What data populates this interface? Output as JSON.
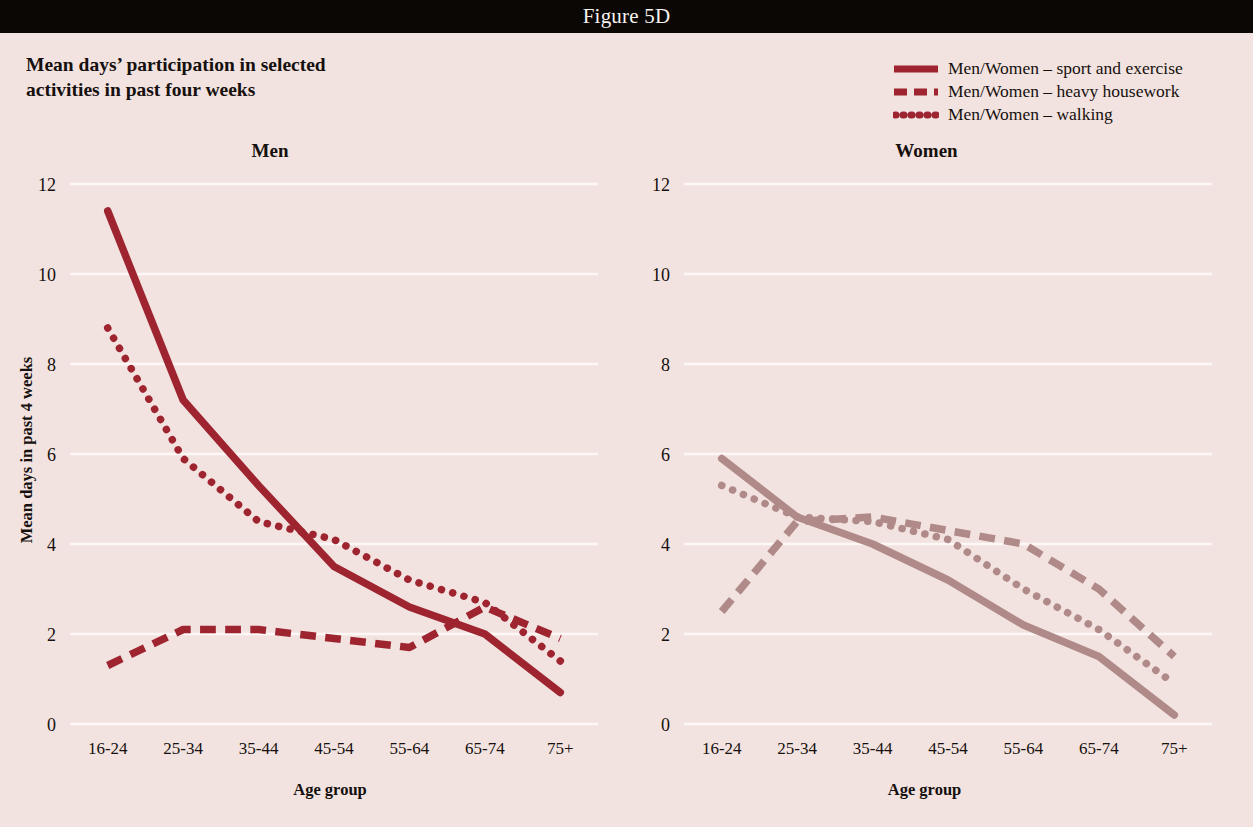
{
  "header": {
    "figure_label": "Figure 5D"
  },
  "title": {
    "line1": "Mean days’ participation in selected",
    "line2": "activities in past four weeks"
  },
  "legend": {
    "position": "top-right",
    "items": [
      {
        "label": "Men/Women – sport and exercise",
        "style": "solid",
        "icon": "solid-line-icon"
      },
      {
        "label": "Men/Women – heavy housework",
        "style": "dashed",
        "icon": "dashed-line-icon"
      },
      {
        "label": "Men/Women – walking",
        "style": "dotted",
        "icon": "dotted-line-icon"
      }
    ]
  },
  "axis": {
    "ylabel": "Mean days in past 4 weeks",
    "xlabel": "Age group",
    "yticks": [
      "0",
      "2",
      "4",
      "6",
      "8",
      "10",
      "12"
    ],
    "xticks": [
      "16-24",
      "25-34",
      "35-44",
      "45-54",
      "55-64",
      "65-74",
      "75+"
    ]
  },
  "panels": [
    {
      "heading": "Men"
    },
    {
      "heading": "Women"
    }
  ],
  "colors": {
    "background": "#f2e3e0",
    "header_bar": "#0b0705",
    "gridline": "#fdf7f5",
    "men_series": "#9e2430",
    "women_series": "#b08a88",
    "text": "#16100e"
  },
  "chart_data": [
    {
      "type": "line",
      "title": "Mean days’ participation in selected activities in past four weeks",
      "subtitle": "Men",
      "xlabel": "Age group",
      "ylabel": "Mean days in past 4 weeks",
      "categories": [
        "16-24",
        "25-34",
        "35-44",
        "45-54",
        "55-64",
        "65-74",
        "75+"
      ],
      "ylim": [
        0,
        12
      ],
      "ytick_step": 2,
      "grid": true,
      "legend_position": "top-right",
      "color": "#9e2430",
      "series": [
        {
          "name": "Men – sport and exercise",
          "style": "solid",
          "values": [
            11.4,
            7.2,
            5.3,
            3.5,
            2.6,
            2.0,
            0.7
          ]
        },
        {
          "name": "Men – heavy housework",
          "style": "dashed",
          "values": [
            1.3,
            2.1,
            2.1,
            1.9,
            1.7,
            2.6,
            1.9
          ]
        },
        {
          "name": "Men – walking",
          "style": "dotted",
          "values": [
            8.8,
            5.9,
            4.5,
            4.1,
            3.2,
            2.7,
            1.4
          ]
        }
      ]
    },
    {
      "type": "line",
      "title": "Mean days’ participation in selected activities in past four weeks",
      "subtitle": "Women",
      "xlabel": "Age group",
      "ylabel": "Mean days in past 4 weeks",
      "categories": [
        "16-24",
        "25-34",
        "35-44",
        "45-54",
        "55-64",
        "65-74",
        "75+"
      ],
      "ylim": [
        0,
        12
      ],
      "ytick_step": 2,
      "grid": true,
      "legend_position": "top-right",
      "color": "#b08a88",
      "series": [
        {
          "name": "Women – sport and exercise",
          "style": "solid",
          "values": [
            5.9,
            4.6,
            4.0,
            3.2,
            2.2,
            1.5,
            0.2
          ]
        },
        {
          "name": "Women – heavy housework",
          "style": "dashed",
          "values": [
            2.5,
            4.5,
            4.6,
            4.3,
            4.0,
            3.0,
            1.5
          ]
        },
        {
          "name": "Women – walking",
          "style": "dotted",
          "values": [
            5.3,
            4.6,
            4.5,
            4.1,
            3.0,
            2.1,
            0.9
          ]
        }
      ]
    }
  ]
}
